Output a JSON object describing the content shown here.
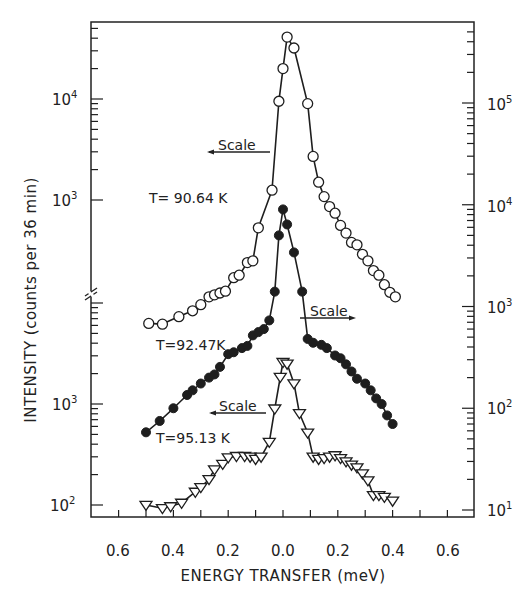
{
  "chart_data": {
    "type": "line",
    "title": "",
    "xlabel": "ENERGY TRANSFER (meV)",
    "ylabel": "INTENSITY (counts per 36 min)",
    "xlim": [
      -0.7,
      0.7
    ],
    "x_tick_values": [
      -0.6,
      -0.4,
      -0.2,
      0.0,
      0.2,
      0.4,
      0.6
    ],
    "x_tick_labels": [
      "0.6",
      "0.4",
      "0.2",
      "0.0",
      "0.2",
      "0.4",
      "0.6"
    ],
    "grid": false,
    "yscale": "log",
    "left_axis": {
      "upper_segment": {
        "ticks": [
          {
            "value": 10000,
            "label": "10^4"
          },
          {
            "value": 1000,
            "label": "10^3"
          }
        ],
        "applies_to": "T = 90.64 K"
      },
      "lower_segment": {
        "ticks": [
          {
            "value": 1000,
            "label": "10^3"
          },
          {
            "value": 100,
            "label": "10^2"
          }
        ],
        "applies_to": "T = 95.13 K"
      },
      "axis_break": true
    },
    "right_axis": {
      "ticks": [
        {
          "value": 100000,
          "label": "10^5"
        },
        {
          "value": 10000,
          "label": "10^4"
        },
        {
          "value": 1000,
          "label": "10^3"
        },
        {
          "value": 100,
          "label": "10^2"
        },
        {
          "value": 10,
          "label": "10^1"
        }
      ],
      "applies_to": "T = 92.47 K"
    },
    "series": [
      {
        "name": "T = 90.64 K",
        "marker": "open-circle",
        "scale": "left-upper",
        "x": [
          -0.49,
          -0.44,
          -0.38,
          -0.33,
          -0.3,
          -0.27,
          -0.25,
          -0.23,
          -0.21,
          -0.18,
          -0.16,
          -0.13,
          -0.11,
          -0.09,
          -0.04,
          -0.015,
          0.0,
          0.015,
          0.04,
          0.09,
          0.11,
          0.13,
          0.15,
          0.17,
          0.19,
          0.21,
          0.23,
          0.25,
          0.27,
          0.29,
          0.31,
          0.33,
          0.35,
          0.37,
          0.39,
          0.41
        ],
        "values": [
          60,
          59,
          70,
          80,
          92,
          110,
          115,
          120,
          125,
          170,
          180,
          240,
          250,
          530,
          1250,
          9500,
          20000,
          41000,
          32000,
          9000,
          2700,
          1500,
          1080,
          860,
          740,
          560,
          470,
          380,
          360,
          290,
          250,
          200,
          180,
          145,
          122,
          110
        ]
      },
      {
        "name": "T = 92.47 K",
        "marker": "filled-circle",
        "scale": "right",
        "x": [
          -0.5,
          -0.45,
          -0.4,
          -0.35,
          -0.33,
          -0.3,
          -0.27,
          -0.25,
          -0.23,
          -0.2,
          -0.18,
          -0.15,
          -0.13,
          -0.11,
          -0.09,
          -0.07,
          -0.05,
          -0.03,
          -0.015,
          0.0,
          0.015,
          0.04,
          0.07,
          0.09,
          0.11,
          0.14,
          0.16,
          0.19,
          0.21,
          0.23,
          0.25,
          0.27,
          0.3,
          0.32,
          0.34,
          0.36,
          0.38,
          0.4
        ],
        "values": [
          58,
          75,
          100,
          135,
          150,
          175,
          200,
          215,
          255,
          340,
          355,
          390,
          410,
          520,
          560,
          600,
          730,
          1400,
          5000,
          9000,
          6400,
          3400,
          1400,
          480,
          440,
          420,
          390,
          330,
          310,
          270,
          230,
          195,
          175,
          150,
          125,
          110,
          85,
          70
        ]
      },
      {
        "name": "T = 95.13 K",
        "marker": "open-triangle-down",
        "scale": "left-lower",
        "x": [
          -0.5,
          -0.44,
          -0.41,
          -0.37,
          -0.32,
          -0.3,
          -0.27,
          -0.25,
          -0.22,
          -0.2,
          -0.17,
          -0.14,
          -0.12,
          -0.1,
          -0.08,
          -0.05,
          -0.03,
          -0.01,
          0.0,
          0.015,
          0.04,
          0.06,
          0.09,
          0.11,
          0.13,
          0.15,
          0.17,
          0.19,
          0.21,
          0.23,
          0.25,
          0.27,
          0.29,
          0.31,
          0.33,
          0.35,
          0.37,
          0.4
        ],
        "values": [
          100,
          93,
          97,
          105,
          135,
          150,
          180,
          225,
          255,
          295,
          305,
          305,
          300,
          285,
          300,
          420,
          900,
          1850,
          2600,
          2500,
          1600,
          810,
          520,
          300,
          285,
          290,
          300,
          310,
          290,
          270,
          250,
          235,
          205,
          175,
          125,
          125,
          120,
          110
        ]
      }
    ],
    "annotations": [
      {
        "text": "T= 90.64 K",
        "position": "left of upper curve"
      },
      {
        "text": "T=92.47K",
        "position": "left of middle curve"
      },
      {
        "text": "T=95.13 K",
        "position": "left of lower curve"
      },
      {
        "text": "Scale",
        "arrow": "left",
        "series": "T = 90.64 K"
      },
      {
        "text": "Scale",
        "arrow": "right",
        "series": "T = 92.47 K"
      },
      {
        "text": "Scale",
        "arrow": "left",
        "series": "T = 95.13 K"
      }
    ],
    "legend": "none (in-plot labels)"
  },
  "labels": {
    "xlabel": "ENERGY TRANSFER (meV)",
    "ylabel": "INTENSITY (counts per 36 min)",
    "x_ticks": [
      "0.6",
      "0.4",
      "0.2",
      "0.0",
      "0.2",
      "0.4",
      "0.6"
    ],
    "left_upper_ticks": [
      "10",
      "10"
    ],
    "left_upper_exps": [
      "4",
      "3"
    ],
    "left_lower_ticks": [
      "10",
      "10"
    ],
    "left_lower_exps": [
      "3",
      "2"
    ],
    "right_ticks": [
      "10",
      "10",
      "10",
      "10",
      "10"
    ],
    "right_exps": [
      "5",
      "4",
      "3",
      "2",
      "1"
    ],
    "t1": "T= 90.64 K",
    "t2": "T=92.47K",
    "t3": "T=95.13 K",
    "scale1": "Scale",
    "scale2": "Scale",
    "scale3": "Scale"
  },
  "colors": {
    "ink": "#1e1e1e",
    "background": "#ffffff"
  }
}
